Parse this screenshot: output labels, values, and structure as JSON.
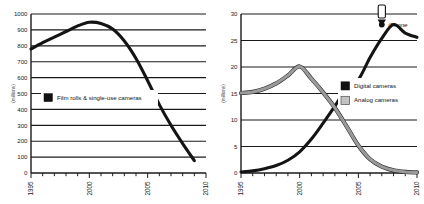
{
  "figure": {
    "panels": [
      "Film rolls & single-use cameras",
      "Digital vs analog cameras"
    ],
    "background": "#ffffff",
    "ink": "#141414",
    "gray": "#9a9a9a"
  },
  "chart_data": [
    {
      "type": "line",
      "title": "",
      "xlabel": "",
      "ylabel": "(millions)",
      "xlim": [
        1995,
        2010
      ],
      "ylim": [
        0,
        1000
      ],
      "yticks": [
        0,
        100,
        200,
        300,
        400,
        500,
        600,
        700,
        800,
        900,
        1000
      ],
      "ytick_labels": [
        "0",
        "100",
        "200",
        "300",
        "400",
        "500",
        "600",
        "700",
        "800",
        "900",
        "1000"
      ],
      "xticks": [
        1995,
        2000,
        2005,
        2010
      ],
      "xtick_labels": [
        "1995",
        "2000",
        "2005",
        "2010"
      ],
      "xminor_step": 1,
      "grid": "horizontal",
      "legend_position": "center-left",
      "series": [
        {
          "name": "Film rolls & single-use cameras",
          "color": "#141414",
          "x": [
            1995,
            1996,
            1997,
            1998,
            1999,
            2000,
            2001,
            2002,
            2003,
            2004,
            2005,
            2006,
            2007,
            2008,
            2009
          ],
          "values": [
            780,
            820,
            855,
            890,
            925,
            948,
            940,
            905,
            830,
            720,
            580,
            430,
            300,
            185,
            78
          ]
        }
      ]
    },
    {
      "type": "line",
      "title": "",
      "xlabel": "",
      "ylabel": "(millions)",
      "xlim": [
        1995,
        2010
      ],
      "ylim": [
        0,
        30
      ],
      "yticks": [
        0,
        5,
        10,
        15,
        20,
        25,
        30
      ],
      "ytick_labels": [
        "0",
        "5",
        "10",
        "15",
        "20",
        "25",
        "30"
      ],
      "xticks": [
        1995,
        2000,
        2005,
        2010
      ],
      "xtick_labels": [
        "1995",
        "2000",
        "2005",
        "2010"
      ],
      "xminor_step": 1,
      "grid": "horizontal",
      "legend_position": "center-right",
      "series": [
        {
          "name": "Digital cameras",
          "color": "#141414",
          "x": [
            1995,
            1996,
            1997,
            1998,
            1999,
            2000,
            2001,
            2002,
            2003,
            2004,
            2005,
            2006,
            2007,
            2008,
            2009,
            2010
          ],
          "values": [
            0.2,
            0.4,
            0.8,
            1.4,
            2.4,
            4.0,
            6.4,
            9.4,
            12.6,
            16.0,
            17.6,
            21.8,
            25.4,
            28.0,
            26.4,
            25.6
          ]
        },
        {
          "name": "Analog cameras",
          "color": "#9a9a9a",
          "x": [
            1995,
            1996,
            1997,
            1998,
            1999,
            2000,
            2001,
            2002,
            2003,
            2004,
            2005,
            2006,
            2007,
            2008,
            2009,
            2010
          ],
          "values": [
            15.1,
            15.3,
            15.9,
            16.9,
            18.4,
            20.1,
            17.8,
            15.2,
            12.3,
            8.8,
            5.2,
            2.6,
            1.2,
            0.5,
            0.2,
            0.1
          ]
        }
      ],
      "annotations": [
        {
          "label": "iPhone",
          "icon": "phone-icon",
          "x": 2007,
          "y": 28.0,
          "marker": "dot"
        }
      ]
    }
  ],
  "left_panel": {
    "legend": [
      {
        "label": "Film rolls & single-use cameras",
        "swatch": "dark"
      }
    ],
    "axis_label": "(millions)"
  },
  "right_panel": {
    "legend": [
      {
        "label": "Digital cameras",
        "swatch": "dark"
      },
      {
        "label": "Analog cameras",
        "swatch": "gray"
      }
    ],
    "axis_label": "(millions)",
    "annotation_label": "iPhone"
  }
}
